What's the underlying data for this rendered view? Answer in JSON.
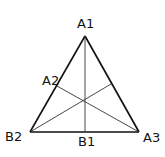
{
  "diagram": {
    "type": "triangle-medians",
    "labels": {
      "apex_top": "A1",
      "left_side_point": "A2",
      "bottom_left": "B2",
      "bottom_mid": "B1",
      "bottom_right": "A3"
    },
    "colors": {
      "stroke": "#111111",
      "background": "#ffffff"
    }
  }
}
